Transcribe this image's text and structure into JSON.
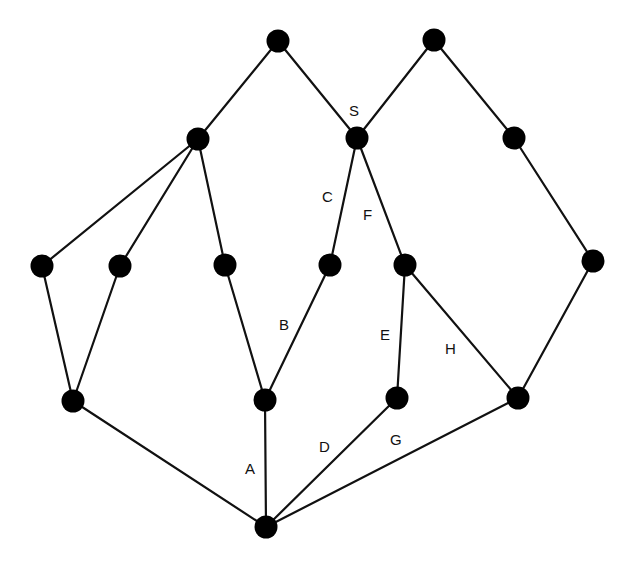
{
  "diagram": {
    "width": 635,
    "height": 574,
    "colors": {
      "background": "#ffffff",
      "node": "#000000",
      "edge": "#111111",
      "label": "#111111"
    },
    "node_radius": 11.5,
    "nodes": [
      {
        "id": "t1",
        "x": 278,
        "y": 41
      },
      {
        "id": "t2",
        "x": 434,
        "y": 40
      },
      {
        "id": "l1",
        "x": 198,
        "y": 139
      },
      {
        "id": "s",
        "x": 357,
        "y": 138
      },
      {
        "id": "r1",
        "x": 514,
        "y": 138
      },
      {
        "id": "m1",
        "x": 42,
        "y": 266
      },
      {
        "id": "m2",
        "x": 120,
        "y": 266
      },
      {
        "id": "m3",
        "x": 225,
        "y": 265
      },
      {
        "id": "m4",
        "x": 330,
        "y": 265
      },
      {
        "id": "m5",
        "x": 405,
        "y": 265
      },
      {
        "id": "m6",
        "x": 593,
        "y": 261
      },
      {
        "id": "b1",
        "x": 73,
        "y": 401
      },
      {
        "id": "b2",
        "x": 265,
        "y": 400
      },
      {
        "id": "b3",
        "x": 397,
        "y": 398
      },
      {
        "id": "b4",
        "x": 518,
        "y": 398
      },
      {
        "id": "bottom",
        "x": 266,
        "y": 527
      }
    ],
    "edges": [
      {
        "from": "t1",
        "to": "l1",
        "label": ""
      },
      {
        "from": "t1",
        "to": "s",
        "label": ""
      },
      {
        "from": "t2",
        "to": "s",
        "label": ""
      },
      {
        "from": "t2",
        "to": "r1",
        "label": ""
      },
      {
        "from": "l1",
        "to": "m1",
        "label": ""
      },
      {
        "from": "l1",
        "to": "m2",
        "label": ""
      },
      {
        "from": "l1",
        "to": "m3",
        "label": ""
      },
      {
        "from": "s",
        "to": "m4",
        "label": "C"
      },
      {
        "from": "s",
        "to": "m5",
        "label": "F"
      },
      {
        "from": "r1",
        "to": "m6",
        "label": ""
      },
      {
        "from": "m1",
        "to": "b1",
        "label": ""
      },
      {
        "from": "m2",
        "to": "b1",
        "label": ""
      },
      {
        "from": "m3",
        "to": "b2",
        "label": ""
      },
      {
        "from": "m4",
        "to": "b2",
        "label": "B"
      },
      {
        "from": "m5",
        "to": "b3",
        "label": "E"
      },
      {
        "from": "m5",
        "to": "b4",
        "label": "H"
      },
      {
        "from": "m6",
        "to": "b4",
        "label": ""
      },
      {
        "from": "b1",
        "to": "bottom",
        "label": ""
      },
      {
        "from": "b2",
        "to": "bottom",
        "label": "A"
      },
      {
        "from": "b3",
        "to": "bottom",
        "label": "D"
      },
      {
        "from": "b4",
        "to": "bottom",
        "label": "G"
      }
    ],
    "labels": [
      {
        "text": "S",
        "x": 349,
        "y": 116
      },
      {
        "text": "C",
        "x": 322,
        "y": 202
      },
      {
        "text": "F",
        "x": 363,
        "y": 220
      },
      {
        "text": "B",
        "x": 279,
        "y": 330
      },
      {
        "text": "E",
        "x": 380,
        "y": 340
      },
      {
        "text": "H",
        "x": 445,
        "y": 354
      },
      {
        "text": "A",
        "x": 245,
        "y": 474
      },
      {
        "text": "D",
        "x": 319,
        "y": 452
      },
      {
        "text": "G",
        "x": 390,
        "y": 445
      }
    ]
  }
}
